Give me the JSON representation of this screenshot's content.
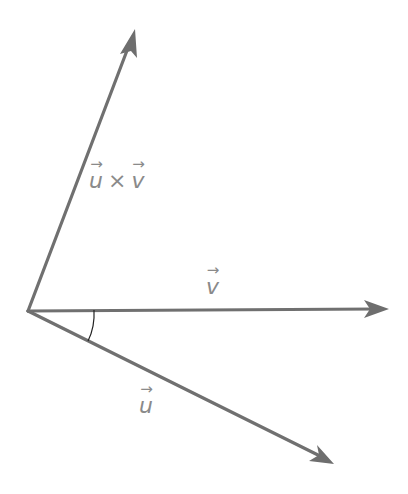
{
  "diagram": {
    "type": "vector-cross-product",
    "colors": {
      "vector": "#707070",
      "label": "#8a8a8a",
      "arc": "#222222",
      "background": "#ffffff"
    },
    "origin": {
      "x": 28,
      "y": 311
    },
    "vectors": [
      {
        "id": "cross",
        "tip": {
          "x": 135,
          "y": 30
        }
      },
      {
        "id": "v",
        "tip": {
          "x": 388,
          "y": 309
        }
      },
      {
        "id": "u",
        "tip": {
          "x": 333,
          "y": 463
        }
      }
    ],
    "labels": {
      "cross": {
        "left": "u",
        "operator": "×",
        "right": "v",
        "arrow": "→"
      },
      "v": {
        "symbol": "v",
        "arrow": "→"
      },
      "u": {
        "symbol": "u",
        "arrow": "→"
      }
    },
    "angle_arc": {
      "between": [
        "v",
        "u"
      ]
    }
  }
}
